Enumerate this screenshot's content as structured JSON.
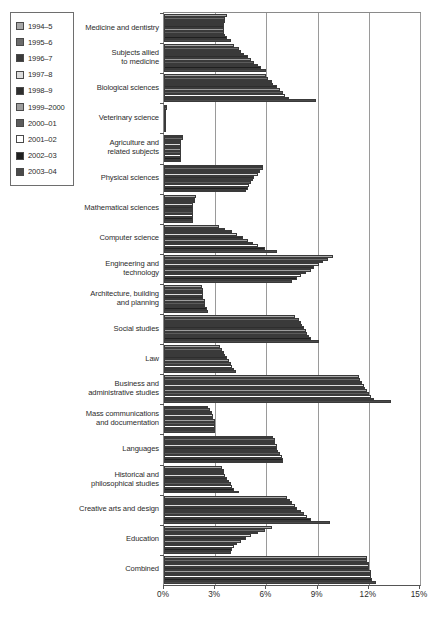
{
  "chart_data": {
    "type": "bar",
    "orientation": "horizontal",
    "title": "",
    "subtitle": "",
    "xlabel": "",
    "ylabel": "",
    "xlim": [
      0,
      15
    ],
    "xunit": "%",
    "xticks": [
      "0%",
      "3%",
      "6%",
      "9%",
      "12%",
      "15%"
    ],
    "xtick_values": [
      0,
      3,
      6,
      9,
      12,
      15
    ],
    "grid": "vertical",
    "legend_position": "top-left",
    "legend_title": "",
    "series": [
      {
        "name": "1994–5",
        "color": "#a8a8a8",
        "values": [
          3.7,
          4.1,
          6.0,
          0.15,
          1.1,
          5.8,
          1.9,
          3.2,
          9.9,
          2.2,
          7.7,
          3.3,
          11.4,
          2.6,
          6.4,
          3.4,
          7.2,
          6.3,
          11.9
        ]
      },
      {
        "name": "1995–6",
        "color": "#6b6b6b",
        "values": [
          3.6,
          4.4,
          6.1,
          0.15,
          1.1,
          5.8,
          1.8,
          3.6,
          9.6,
          2.3,
          7.9,
          3.4,
          11.5,
          2.7,
          6.5,
          3.5,
          7.4,
          5.9,
          11.9
        ]
      },
      {
        "name": "1996–7",
        "color": "#3a3a3a",
        "values": [
          3.6,
          4.5,
          6.3,
          0.14,
          1.0,
          5.6,
          1.8,
          4.0,
          9.3,
          2.3,
          8.0,
          3.5,
          11.6,
          2.8,
          6.5,
          3.5,
          7.5,
          5.5,
          12.0
        ]
      },
      {
        "name": "1997–8",
        "color": "#dcdcdc",
        "values": [
          3.5,
          4.7,
          6.4,
          0.13,
          1.0,
          5.5,
          1.7,
          4.3,
          9.1,
          2.3,
          8.1,
          3.6,
          11.7,
          2.9,
          6.6,
          3.6,
          7.7,
          5.1,
          12.0
        ]
      },
      {
        "name": "1998–9",
        "color": "#2e2e2e",
        "values": [
          3.5,
          4.9,
          6.6,
          0.13,
          1.0,
          5.3,
          1.7,
          4.6,
          8.8,
          2.3,
          8.2,
          3.7,
          11.8,
          2.9,
          6.6,
          3.7,
          7.8,
          4.8,
          12.0
        ]
      },
      {
        "name": "1999–2000",
        "color": "#9e9e9e",
        "values": [
          3.5,
          5.1,
          6.8,
          0.12,
          1.0,
          5.2,
          1.7,
          4.9,
          8.6,
          2.4,
          8.3,
          3.8,
          11.9,
          3.0,
          6.7,
          3.8,
          8.0,
          4.5,
          12.1
        ]
      },
      {
        "name": "2000–01",
        "color": "#5c5c5c",
        "values": [
          3.5,
          5.3,
          7.0,
          0.12,
          1.0,
          5.1,
          1.7,
          5.2,
          8.3,
          2.4,
          8.4,
          3.9,
          12.0,
          3.0,
          6.8,
          3.9,
          8.2,
          4.3,
          12.1
        ]
      },
      {
        "name": "2001–02",
        "color": "#ffffff",
        "values": [
          3.6,
          5.5,
          7.1,
          0.12,
          1.0,
          5.0,
          1.7,
          5.5,
          8.0,
          2.4,
          8.5,
          4.0,
          12.1,
          3.0,
          6.9,
          4.0,
          8.4,
          4.1,
          12.1
        ]
      },
      {
        "name": "2002–03",
        "color": "#1f1f1f",
        "values": [
          3.7,
          5.7,
          7.3,
          0.12,
          1.0,
          4.9,
          1.7,
          5.9,
          7.8,
          2.5,
          8.6,
          4.1,
          12.3,
          3.0,
          7.0,
          4.1,
          8.6,
          4.0,
          12.2
        ]
      },
      {
        "name": "2003–04",
        "color": "#4a4a4a",
        "values": [
          3.9,
          6.0,
          8.9,
          0.12,
          1.0,
          4.8,
          1.7,
          6.6,
          7.5,
          2.6,
          9.1,
          4.2,
          13.3,
          3.0,
          7.0,
          4.4,
          9.7,
          3.9,
          12.4
        ]
      }
    ],
    "categories": [
      "Medicine and dentistry",
      "Subjects allied\nto medicine",
      "Biological sciences",
      "Veterinary science",
      "Agriculture and\nrelated subjects",
      "Physical sciences",
      "Mathematical sciences",
      "Computer science",
      "Engineering and\ntechnology",
      "Architecture, building\nand planning",
      "Social studies",
      "Law",
      "Business and\nadministrative studies",
      "Mass communications\nand documentation",
      "Languages",
      "Historical and\nphilosophical studies",
      "Creative arts and design",
      "Education",
      "Combined"
    ]
  }
}
